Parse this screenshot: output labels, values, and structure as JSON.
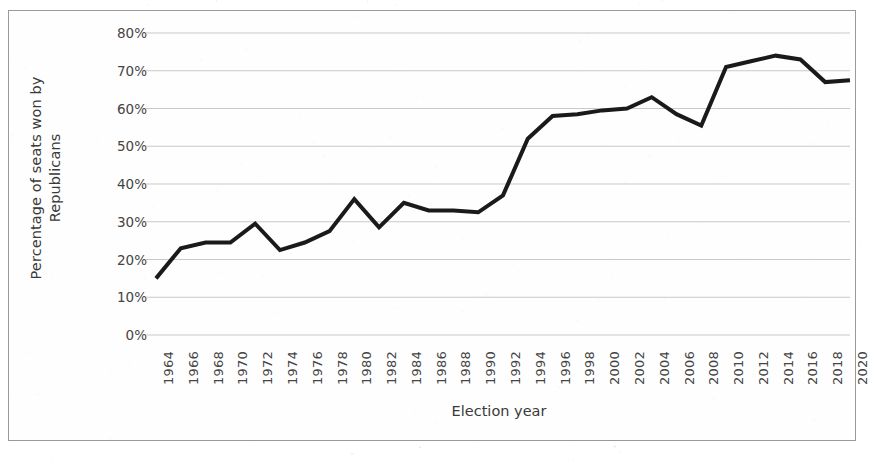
{
  "chart_data": {
    "type": "line",
    "title": "",
    "xlabel": "Election year",
    "ylabel": "Percentage of seats won by Republicans",
    "ylabel_lines": [
      "Percentage of seats won by",
      "Republicans"
    ],
    "ylim": [
      0,
      80
    ],
    "ytick_values": [
      0,
      10,
      20,
      30,
      40,
      50,
      60,
      70,
      80
    ],
    "ytick_labels": [
      "0%",
      "10%",
      "20%",
      "30%",
      "40%",
      "50%",
      "60%",
      "70%",
      "80%"
    ],
    "grid": true,
    "grid_axis": "y",
    "legend": false,
    "legend_position": "none",
    "line_color": "#1a1a1a",
    "line_width": 4,
    "markers": false,
    "categories": [
      "1964",
      "1966",
      "1968",
      "1970",
      "1972",
      "1974",
      "1976",
      "1978",
      "1980",
      "1982",
      "1984",
      "1986",
      "1988",
      "1990",
      "1992",
      "1994",
      "1996",
      "1998",
      "2000",
      "2002",
      "2004",
      "2006",
      "2008",
      "2010",
      "2012",
      "2014",
      "2016",
      "2018",
      "2020"
    ],
    "x": [
      1964,
      1966,
      1968,
      1970,
      1972,
      1974,
      1976,
      1978,
      1980,
      1982,
      1984,
      1986,
      1988,
      1990,
      1992,
      1994,
      1996,
      1998,
      2000,
      2002,
      2004,
      2006,
      2008,
      2010,
      2012,
      2014,
      2016,
      2018,
      2020
    ],
    "values": [
      15.0,
      23.0,
      24.5,
      24.5,
      29.5,
      22.5,
      24.5,
      27.5,
      36.0,
      28.5,
      35.0,
      33.0,
      33.0,
      32.5,
      37.0,
      52.0,
      58.0,
      58.5,
      59.5,
      60.0,
      63.0,
      58.5,
      55.5,
      71.0,
      72.5,
      74.0,
      73.0,
      67.0,
      67.5
    ],
    "series": [
      {
        "name": "Percentage of seats won by Republicans",
        "values": [
          15.0,
          23.0,
          24.5,
          24.5,
          29.5,
          22.5,
          24.5,
          27.5,
          36.0,
          28.5,
          35.0,
          33.0,
          33.0,
          32.5,
          37.0,
          52.0,
          58.0,
          58.5,
          59.5,
          60.0,
          63.0,
          58.5,
          55.5,
          71.0,
          72.5,
          74.0,
          73.0,
          67.0,
          67.5
        ]
      }
    ]
  },
  "colors": {
    "line": "#1a1a1a",
    "grid": "#c9c9c9",
    "axis_text": "#444444",
    "frame": "#9a9a9a",
    "background": "#fefefe"
  }
}
